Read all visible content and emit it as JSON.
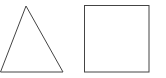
{
  "diagram": {
    "background": "#ffffff",
    "stroke_color": "#444444",
    "shapes": [
      {
        "type": "triangle",
        "points": [
          [
            26,
            6
          ],
          [
            0,
            72
          ],
          [
            63,
            72
          ]
        ]
      },
      {
        "type": "square",
        "x": 84,
        "y": 5,
        "width": 65,
        "height": 67
      }
    ]
  }
}
